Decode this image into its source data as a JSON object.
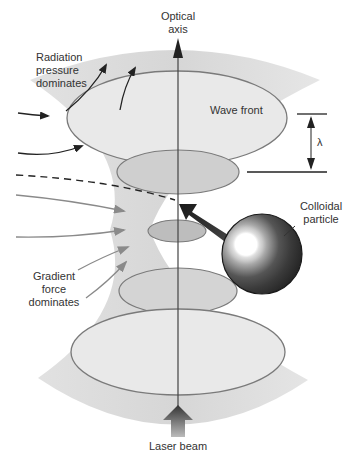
{
  "diagram": {
    "labels": {
      "optical_axis_line1": "Optical",
      "optical_axis_line2": "axis",
      "radiation_line1": "Radiation",
      "radiation_line2": "pressure",
      "radiation_line3": "dominates",
      "wave_front": "Wave front",
      "lambda": "λ",
      "colloidal_line1": "Colloidal",
      "colloidal_line2": "particle",
      "gradient_line1": "Gradient",
      "gradient_line2": "force",
      "gradient_line3": "dominates",
      "laser_beam": "Laser beam"
    },
    "elements": [
      {
        "name": "focused-beam-cone",
        "type": "hourglass shape",
        "color": "#e6e6e6"
      },
      {
        "name": "wave-front-ellipses",
        "count": 5,
        "note": "shrinking toward beam waist"
      },
      {
        "name": "optical-axis-arrow",
        "direction": "up"
      },
      {
        "name": "laser-beam-arrow",
        "direction": "up"
      },
      {
        "name": "wavelength-marker",
        "symbol": "λ"
      },
      {
        "name": "colloidal-particle",
        "type": "shaded sphere"
      },
      {
        "name": "trapping-force-arrow",
        "direction": "toward beam focus"
      },
      {
        "name": "radiation-pressure-arrows",
        "count": 4,
        "color": "#222222"
      },
      {
        "name": "gradient-force-arrows",
        "count": 4,
        "color": "#888888"
      },
      {
        "name": "particle-trajectory",
        "style": "dashed"
      }
    ],
    "colors": {
      "beam_light": "#e8e8e8",
      "beam_mid": "#d0d0d0",
      "ellipse_fill_dark": "#c4c4c4",
      "ellipse_stroke": "#7a7a7a",
      "dark_arrow": "#222222",
      "gray_arrow": "#8a8a8a",
      "text": "#333333"
    }
  }
}
